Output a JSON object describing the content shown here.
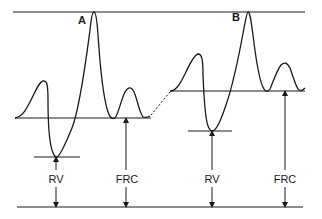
{
  "diagram": {
    "title": "",
    "panels": [
      {
        "id": "A",
        "label": "A",
        "rv_label": "RV",
        "frc_label": "FRC"
      },
      {
        "id": "B",
        "label": "B",
        "rv_label": "RV",
        "frc_label": "FRC"
      }
    ],
    "colors": {
      "ink": "#1a1a1a",
      "background": "#ffffff"
    }
  }
}
